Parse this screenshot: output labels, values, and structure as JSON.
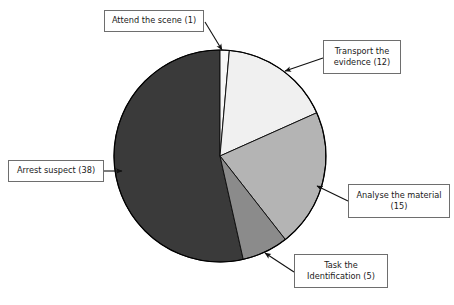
{
  "figure": {
    "background_color": "#ffffff",
    "pie": {
      "center_x": 220,
      "center_y": 156,
      "radius": 106,
      "outline_color": "#000000",
      "start_angle_deg": 0,
      "direction": "clockwise"
    }
  },
  "chart_data": {
    "type": "pie",
    "title": "",
    "total": 71,
    "categories": [
      "Attend the scene",
      "Transport the evidence",
      "Analyse the material",
      "Task the Identification",
      "Arrest suspect"
    ],
    "values": [
      1,
      12,
      15,
      5,
      38
    ],
    "colors": [
      "#f7f7f7",
      "#f0f0f0",
      "#b4b4b4",
      "#8b8b8b",
      "#3a3a3a"
    ],
    "legend": "callout-labels",
    "grid": false,
    "labels": [
      {
        "id": "attend",
        "text": "Attend the scene (1)",
        "name": "Attend the scene",
        "value": 1,
        "color": "#f7f7f7"
      },
      {
        "id": "transport",
        "text": "Transport the\nevidence (12)",
        "name": "Transport the evidence",
        "value": 12,
        "color": "#f0f0f0"
      },
      {
        "id": "analyse",
        "text": "Analyse the material\n(15)",
        "name": "Analyse the material",
        "value": 15,
        "color": "#b4b4b4"
      },
      {
        "id": "task",
        "text": "Task the\nIdentification (5)",
        "name": "Task the Identification",
        "value": 5,
        "color": "#8b8b8b"
      },
      {
        "id": "arrest",
        "text": "Arrest suspect (38)",
        "name": "Arrest suspect",
        "value": 38,
        "color": "#3a3a3a"
      }
    ]
  }
}
